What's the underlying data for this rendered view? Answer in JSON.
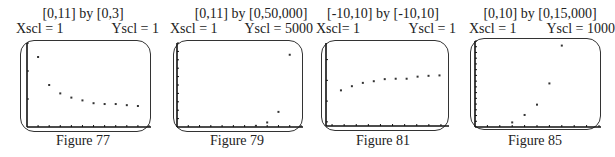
{
  "figures": [
    {
      "caption": "Figure 77",
      "window": "[0,11] by [0,3]",
      "xscl": "Xscl = 1",
      "yscl": "Yscl = 1"
    },
    {
      "caption": "Figure 79",
      "window": "[0,11] by [0,50,000]",
      "xscl": "Xscl = 1",
      "yscl": "Yscl = 5000"
    },
    {
      "caption": "Figure 81",
      "window": "[-10,10] by [-10,10]",
      "xscl": "Xscl= 1",
      "yscl": "Yscl = 1"
    },
    {
      "caption": "Figure 85",
      "window": "[0,10] by [0,15,000]",
      "xscl": "Xscl = 1",
      "yscl": "Yscl = 1000"
    }
  ],
  "chart_data": [
    {
      "type": "scatter",
      "title": "Figure 77",
      "subtitle": "[0,11] by [0,3]",
      "xlim": [
        0,
        11
      ],
      "ylim": [
        0,
        3
      ],
      "xscl": 1,
      "yscl": 1,
      "x": [
        1,
        2,
        3,
        4,
        5,
        6,
        7,
        8,
        9,
        10
      ],
      "y": [
        2.5,
        1.5,
        1.2,
        1.05,
        0.95,
        0.85,
        0.82,
        0.82,
        0.78,
        0.75
      ],
      "grid": false,
      "legend": false
    },
    {
      "type": "scatter",
      "title": "Figure 79",
      "subtitle": "[0,11] by [0,50,000]",
      "xlim": [
        0,
        11
      ],
      "ylim": [
        0,
        50000
      ],
      "xscl": 1,
      "yscl": 5000,
      "x": [
        7,
        8,
        9,
        10
      ],
      "y": [
        700,
        2700,
        9000,
        43000
      ],
      "grid": false,
      "legend": false
    },
    {
      "type": "scatter",
      "title": "Figure 81",
      "subtitle": "[-10,10] by [-10,10]",
      "xlim": [
        -10,
        10
      ],
      "ylim": [
        -10,
        10
      ],
      "xscl": 1,
      "yscl": 1,
      "x": [
        1,
        2,
        3,
        4,
        5,
        6,
        7,
        8,
        9,
        10
      ],
      "y": [
        1.0,
        2.0,
        2.8,
        3.2,
        3.7,
        3.8,
        3.8,
        4.3,
        4.5,
        4.6
      ],
      "grid": false,
      "legend": false
    },
    {
      "type": "scatter",
      "title": "Figure 85",
      "subtitle": "[0,10] by [0,15,000]",
      "xlim": [
        0,
        10
      ],
      "ylim": [
        0,
        15000
      ],
      "xscl": 1,
      "yscl": 1000,
      "x": [
        3,
        4,
        5,
        6,
        7
      ],
      "y": [
        800,
        2100,
        3900,
        7600,
        14200
      ],
      "grid": false,
      "legend": false
    }
  ]
}
